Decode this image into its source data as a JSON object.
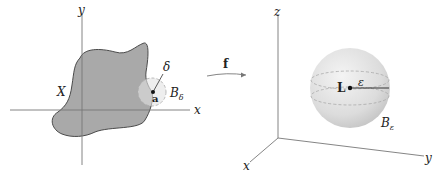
{
  "figure": {
    "left_panel": {
      "axes": {
        "x_label": "x",
        "y_label": "y"
      },
      "set_label": "X",
      "point_label": "a",
      "radius_label": "δ",
      "ball_label": "B",
      "ball_subscript": "δ"
    },
    "mapping": {
      "label": "f"
    },
    "right_panel": {
      "axes": {
        "x_label": "x",
        "y_label": "y",
        "z_label": "z"
      },
      "point_label": "L",
      "radius_label": "ε",
      "ball_label": "B",
      "ball_subscript": "ε"
    },
    "colors": {
      "region_fill": "#a9a9a9",
      "region_stroke": "#4a4a4a",
      "ball_fill": "#e2e2e2",
      "sphere_fill": "#dcdcdc",
      "axis": "#777777",
      "dashed": "#9a9a9a"
    }
  }
}
